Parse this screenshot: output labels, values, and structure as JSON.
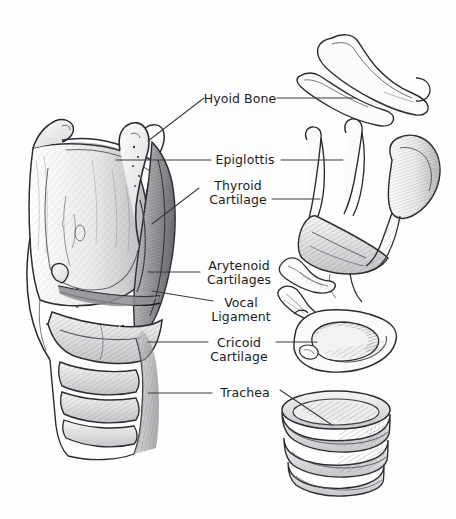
{
  "figure": {
    "style": "hand-drawn pencil and ink anatomical illustration",
    "background_color": "#fefefe",
    "ink_color": "#1b1b1b",
    "leader_line_color": "#3a3a3a",
    "width": 456,
    "height": 519
  },
  "labels": [
    {
      "id": "hyoid-bone",
      "lines": [
        "Hyoid Bone"
      ],
      "text": "Hyoid Bone",
      "text_x": 240,
      "text_y": 99,
      "leaders": [
        {
          "type": "diagonal",
          "points": "148,141 204,98"
        },
        {
          "type": "horizontal",
          "points": "277,98 356,98"
        }
      ]
    },
    {
      "id": "epiglottis",
      "lines": [
        "Epiglottis"
      ],
      "text": "Epiglottis",
      "text_x": 245,
      "text_y": 160,
      "leaders": [
        {
          "type": "horizontal",
          "points": "116,160 211,160"
        },
        {
          "type": "horizontal",
          "points": "281,160 343,160"
        }
      ]
    },
    {
      "id": "thyroid-cartilage",
      "lines": [
        "Thyroid",
        "Cartilage"
      ],
      "text": "Thyroid Cartilage",
      "text_x": 238,
      "text_y": 186,
      "leaders": [
        {
          "type": "diagonal",
          "points": "152,224 199,188"
        },
        {
          "type": "horizontal",
          "points": "272,199 320,199"
        }
      ]
    },
    {
      "id": "arytenoid-cartilages",
      "lines": [
        "Arytenoid",
        "Cartilages"
      ],
      "text": "Arytenoid Cartilages",
      "text_x": 239,
      "text_y": 266,
      "leaders": [
        {
          "type": "horizontal",
          "points": "148,272 200,272"
        }
      ]
    },
    {
      "id": "vocal-ligament",
      "lines": [
        "Vocal",
        "Ligament"
      ],
      "text": "Vocal Ligament",
      "text_x": 241,
      "text_y": 303,
      "leaders": [
        {
          "type": "diagonal",
          "points": "152,291 213,301"
        }
      ]
    },
    {
      "id": "cricoid-cartilage",
      "lines": [
        "Cricoid",
        "Cartilage"
      ],
      "text": "Cricoid Cartilage",
      "text_x": 239,
      "text_y": 343,
      "leaders": [
        {
          "type": "horizontal",
          "points": "148,342 208,342"
        },
        {
          "type": "horizontal",
          "points": "276,342 317,342"
        }
      ]
    },
    {
      "id": "trachea",
      "lines": [
        "Trachea"
      ],
      "text": "Trachea",
      "text_x": 245,
      "text_y": 393,
      "leaders": [
        {
          "type": "horizontal",
          "points": "148,393 212,393"
        },
        {
          "type": "diagonal",
          "points": "280,390 332,425"
        }
      ]
    }
  ],
  "illustrations": [
    {
      "id": "main-larynx-sagittal",
      "name": "Larynx sagittal section",
      "region": {
        "x": 14,
        "y": 118,
        "w": 170,
        "h": 340
      }
    },
    {
      "id": "inset-hyoid-bone",
      "name": "Hyoid bone",
      "region": {
        "x": 295,
        "y": 25,
        "w": 145,
        "h": 85
      }
    },
    {
      "id": "inset-thyroid-cartilage",
      "name": "Thyroid cartilage with epiglottis",
      "region": {
        "x": 300,
        "y": 120,
        "w": 145,
        "h": 125
      }
    },
    {
      "id": "inset-arytenoid-cartilages",
      "name": "Arytenoid cartilages",
      "region": {
        "x": 276,
        "y": 252,
        "w": 62,
        "h": 58
      }
    },
    {
      "id": "inset-cricoid-cartilage",
      "name": "Cricoid cartilage",
      "region": {
        "x": 292,
        "y": 306,
        "w": 110,
        "h": 72
      }
    },
    {
      "id": "inset-trachea",
      "name": "Trachea cartilage rings",
      "region": {
        "x": 278,
        "y": 392,
        "w": 120,
        "h": 88
      }
    }
  ]
}
